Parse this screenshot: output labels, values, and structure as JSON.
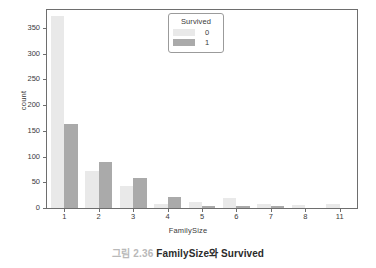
{
  "caption": {
    "number": "그림 2.36",
    "text": "FamilySize와 Survived"
  },
  "legend": {
    "title": "Survived",
    "entries": [
      {
        "label": "0",
        "color": "#e9e9e9"
      },
      {
        "label": "1",
        "color": "#aaaaaa"
      }
    ]
  },
  "axes": {
    "xlabel": "FamilySize",
    "ylabel": "count",
    "yticks": [
      "0",
      "50",
      "100",
      "150",
      "200",
      "250",
      "300",
      "350"
    ],
    "xticks": [
      "1",
      "2",
      "3",
      "4",
      "5",
      "6",
      "7",
      "8",
      "11"
    ]
  },
  "chart_data": {
    "type": "bar",
    "title": "",
    "xlabel": "FamilySize",
    "ylabel": "count",
    "categories": [
      "1",
      "2",
      "3",
      "4",
      "5",
      "6",
      "7",
      "8",
      "11"
    ],
    "series": [
      {
        "name": "0",
        "color": "#e9e9e9",
        "values": [
          374,
          72,
          43,
          8,
          12,
          19,
          8,
          6,
          7
        ]
      },
      {
        "name": "1",
        "color": "#aaaaaa",
        "values": [
          163,
          89,
          59,
          21,
          3,
          3,
          4,
          0,
          0
        ]
      }
    ],
    "ylim": [
      0,
      385
    ],
    "ytick_values": [
      0,
      50,
      100,
      150,
      200,
      250,
      300,
      350
    ],
    "grid": false,
    "legend_title": "Survived",
    "legend_position": "upper center"
  }
}
